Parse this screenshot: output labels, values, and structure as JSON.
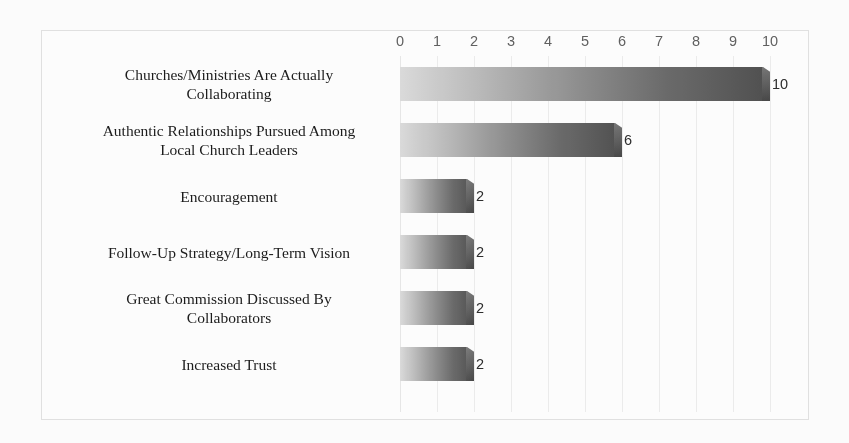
{
  "chart_data": {
    "type": "bar",
    "orientation": "horizontal",
    "title": "",
    "xlabel": "",
    "ylabel": "",
    "xlim": [
      0,
      10
    ],
    "x_ticks": [
      "0",
      "1",
      "2",
      "3",
      "4",
      "5",
      "6",
      "7",
      "8",
      "9",
      "10"
    ],
    "grid": true,
    "legend": "none",
    "categories": [
      "Churches/Ministries Are Actually Collaborating",
      "Authentic Relationships Pursued Among Local Church Leaders",
      "Encouragement",
      "Follow-Up Strategy/Long-Term Vision",
      "Great Commission Discussed By Collaborators",
      "Increased Trust"
    ],
    "values": [
      10,
      6,
      2,
      2,
      2,
      2
    ],
    "value_labels": [
      "10",
      "6",
      "2",
      "2",
      "2",
      "2"
    ],
    "bars": [
      {
        "label_line1": "Churches/Ministries Are Actually",
        "label_line2": "Collaborating",
        "value": 10,
        "value_label": "10"
      },
      {
        "label_line1": "Authentic Relationships Pursued Among",
        "label_line2": "Local Church Leaders",
        "value": 6,
        "value_label": "6"
      },
      {
        "label_line1": "Encouragement",
        "label_line2": "",
        "value": 2,
        "value_label": "2"
      },
      {
        "label_line1": "Follow-Up Strategy/Long-Term Vision",
        "label_line2": "",
        "value": 2,
        "value_label": "2"
      },
      {
        "label_line1": "Great Commission Discussed By",
        "label_line2": "Collaborators",
        "value": 2,
        "value_label": "2"
      },
      {
        "label_line1": "Increased Trust",
        "label_line2": "",
        "value": 2,
        "value_label": "2"
      }
    ],
    "colors": {
      "bar_gradient_start": "#dcdcdc",
      "bar_gradient_end": "#4e4e4e",
      "gridline": "#ededed",
      "frame": "#e2e2e2",
      "background": "#ffffff",
      "label_text": "#1a1a1a",
      "tick_text": "#5f5f5f"
    }
  }
}
